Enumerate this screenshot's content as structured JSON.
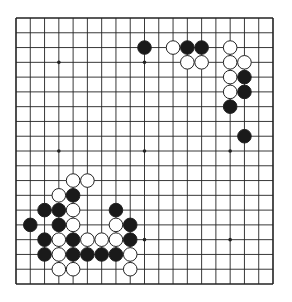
{
  "diagram": {
    "type": "go-board",
    "size": 19,
    "colors": {
      "background": "#ffffff",
      "line": "#222222",
      "black_stone": "#1a1a1a",
      "white_stone": "#ffffff",
      "stone_outline": "#222222"
    },
    "geometry": {
      "left": 16,
      "top": 18,
      "right": 273,
      "bottom": 284,
      "stone_radius": 6.8,
      "star_radius": 1.8
    },
    "star_points": [
      [
        3,
        3
      ],
      [
        9,
        3
      ],
      [
        15,
        3
      ],
      [
        3,
        9
      ],
      [
        9,
        9
      ],
      [
        15,
        9
      ],
      [
        3,
        15
      ],
      [
        9,
        15
      ],
      [
        15,
        15
      ]
    ],
    "stones": [
      {
        "c": 9,
        "r": 2,
        "color": "black"
      },
      {
        "c": 11,
        "r": 2,
        "color": "white"
      },
      {
        "c": 12,
        "r": 2,
        "color": "black"
      },
      {
        "c": 13,
        "r": 2,
        "color": "black"
      },
      {
        "c": 15,
        "r": 2,
        "color": "white"
      },
      {
        "c": 12,
        "r": 3,
        "color": "white"
      },
      {
        "c": 13,
        "r": 3,
        "color": "white"
      },
      {
        "c": 15,
        "r": 3,
        "color": "white"
      },
      {
        "c": 16,
        "r": 3,
        "color": "white"
      },
      {
        "c": 15,
        "r": 4,
        "color": "white"
      },
      {
        "c": 16,
        "r": 4,
        "color": "black"
      },
      {
        "c": 15,
        "r": 5,
        "color": "white"
      },
      {
        "c": 16,
        "r": 5,
        "color": "black"
      },
      {
        "c": 15,
        "r": 6,
        "color": "black"
      },
      {
        "c": 16,
        "r": 8,
        "color": "black"
      },
      {
        "c": 4,
        "r": 11,
        "color": "white"
      },
      {
        "c": 5,
        "r": 11,
        "color": "white"
      },
      {
        "c": 3,
        "r": 12,
        "color": "white"
      },
      {
        "c": 4,
        "r": 12,
        "color": "black"
      },
      {
        "c": 2,
        "r": 13,
        "color": "black"
      },
      {
        "c": 3,
        "r": 13,
        "color": "black"
      },
      {
        "c": 4,
        "r": 13,
        "color": "white"
      },
      {
        "c": 7,
        "r": 13,
        "color": "black"
      },
      {
        "c": 1,
        "r": 14,
        "color": "black"
      },
      {
        "c": 3,
        "r": 14,
        "color": "black"
      },
      {
        "c": 4,
        "r": 14,
        "color": "white"
      },
      {
        "c": 7,
        "r": 14,
        "color": "white"
      },
      {
        "c": 8,
        "r": 14,
        "color": "black"
      },
      {
        "c": 2,
        "r": 15,
        "color": "black"
      },
      {
        "c": 3,
        "r": 15,
        "color": "white"
      },
      {
        "c": 4,
        "r": 15,
        "color": "black"
      },
      {
        "c": 5,
        "r": 15,
        "color": "white"
      },
      {
        "c": 6,
        "r": 15,
        "color": "white"
      },
      {
        "c": 7,
        "r": 15,
        "color": "white"
      },
      {
        "c": 8,
        "r": 15,
        "color": "black"
      },
      {
        "c": 2,
        "r": 16,
        "color": "black"
      },
      {
        "c": 3,
        "r": 16,
        "color": "white"
      },
      {
        "c": 4,
        "r": 16,
        "color": "black"
      },
      {
        "c": 5,
        "r": 16,
        "color": "black"
      },
      {
        "c": 6,
        "r": 16,
        "color": "black"
      },
      {
        "c": 7,
        "r": 16,
        "color": "black"
      },
      {
        "c": 8,
        "r": 16,
        "color": "white"
      },
      {
        "c": 3,
        "r": 17,
        "color": "white"
      },
      {
        "c": 4,
        "r": 17,
        "color": "white"
      },
      {
        "c": 8,
        "r": 17,
        "color": "white"
      }
    ]
  }
}
